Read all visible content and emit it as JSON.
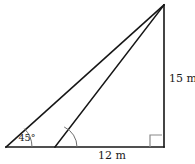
{
  "figure": {
    "background_color": "#ffffff",
    "line_color": "#161616",
    "arc_color": "#6e6e6e",
    "right_angle_color": "#8a8a8a",
    "labels": {
      "vertical_side": "15 m",
      "base_side": "12 m",
      "base_angle": "45°"
    },
    "geometry": {
      "apex": {
        "x": 164,
        "y": 5
      },
      "bottom_left": {
        "x": 6,
        "y": 147
      },
      "bottom_right": {
        "x": 164,
        "y": 147
      },
      "cevian_base": {
        "x": 55,
        "y": 147
      },
      "angle_arc_radius_left": 26,
      "angle_arc_radius_cevian": 22,
      "right_angle_size": 12
    },
    "label_positions": {
      "vertical_side": {
        "x": 169,
        "y": 79
      },
      "base_side": {
        "x": 112,
        "y": 156
      },
      "base_angle": {
        "x": 27,
        "y": 138
      }
    },
    "paths": {
      "hypotenuse": "M 6 147 L 164 5",
      "vertical": "M 164 5 L 164 147",
      "base": "M 6 147 L 164 147",
      "cevian": "M 55 147 L 164 5",
      "arc_left": "M 32 147 A 26 26 0 0 0 24.31 128.61",
      "arc_cevian": "M 77 147 A 22 22 0 0 0 64.18 126.98",
      "right_angle_marker": "M 150 147 L 150 135 L 162 135"
    }
  }
}
